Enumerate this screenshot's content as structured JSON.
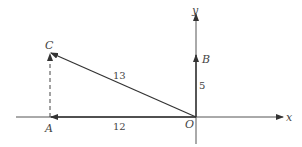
{
  "diagram": {
    "type": "vector-diagram",
    "axes": {
      "x_label": "x",
      "y_label": "y"
    },
    "points": {
      "O": {
        "label": "O"
      },
      "A": {
        "label": "A"
      },
      "B": {
        "label": "B"
      },
      "C": {
        "label": "C"
      }
    },
    "lengths": {
      "OA": "12",
      "OB": "5",
      "OC": "13"
    },
    "colors": {
      "stroke": "#444444",
      "background": "#ffffff"
    }
  }
}
